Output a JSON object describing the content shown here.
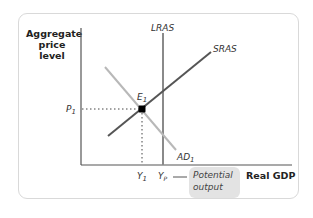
{
  "diagram": {
    "y_axis_label": "Aggregate price level",
    "y_axis_label_lines": [
      "Aggregate",
      "price",
      "level"
    ],
    "x_axis_label": "Real GDP",
    "curves": {
      "lras": {
        "label": "LRAS",
        "color": "#8a8a8a"
      },
      "sras": {
        "label": "SRAS",
        "color": "#555555"
      },
      "ad": {
        "label": "AD",
        "subscript": "1",
        "color": "#b8b8b8"
      }
    },
    "equilibrium": {
      "label": "E",
      "subscript": "1"
    },
    "price_label": {
      "label": "P",
      "subscript": "1"
    },
    "output_label": {
      "label": "Y",
      "subscript": "1"
    },
    "potential_label": {
      "label": "Y",
      "subscript": "P"
    },
    "callout": {
      "line1": "Potential",
      "line2": "output"
    }
  }
}
